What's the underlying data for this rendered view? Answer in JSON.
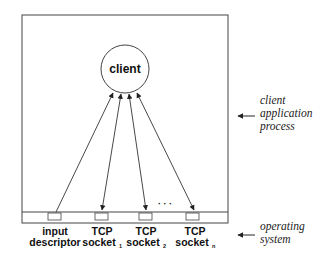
{
  "diagram": {
    "client_label": "client",
    "dots": "· · ·",
    "descriptors": [
      {
        "line1": "input",
        "line2": "descriptor",
        "sub": ""
      },
      {
        "line1": "TCP",
        "line2": "socket",
        "sub": "1"
      },
      {
        "line1": "TCP",
        "line2": "socket",
        "sub": "2"
      },
      {
        "line1": "TCP",
        "line2": "socket",
        "sub": "n"
      }
    ],
    "side_labels": {
      "process": [
        "client",
        "application",
        "process"
      ],
      "os": [
        "operating",
        "system"
      ]
    },
    "colors": {
      "stroke": "#333333",
      "text": "#111111"
    }
  }
}
